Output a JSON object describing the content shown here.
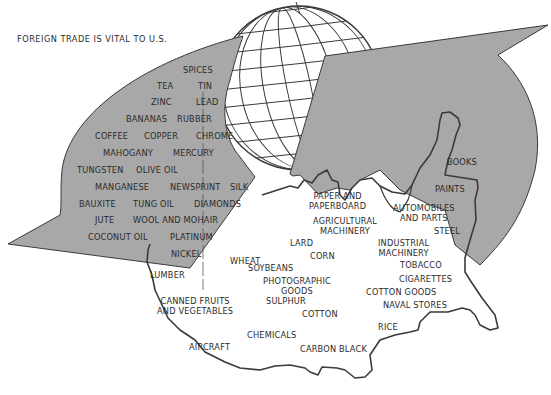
{
  "title": "FOREIGN TRADE IS VITAL TO U.S.",
  "colors": {
    "arrow_fill": "#a8a8a8",
    "outline": "#3a3a3a",
    "text": "#2b2b2b",
    "background": "#ffffff"
  },
  "imports": {
    "label": "Imports (left arrow into U.S.)",
    "items": [
      {
        "text": "SPICES",
        "x": 183,
        "y": 65
      },
      {
        "text": "TEA",
        "x": 157,
        "y": 81
      },
      {
        "text": "TIN",
        "x": 198,
        "y": 81
      },
      {
        "text": "ZINC",
        "x": 151,
        "y": 97
      },
      {
        "text": "LEAD",
        "x": 196,
        "y": 97
      },
      {
        "text": "BANANAS",
        "x": 126,
        "y": 114
      },
      {
        "text": "RUBBER",
        "x": 177,
        "y": 114
      },
      {
        "text": "COFFEE",
        "x": 95,
        "y": 131
      },
      {
        "text": "COPPER",
        "x": 144,
        "y": 131
      },
      {
        "text": "CHROME",
        "x": 196,
        "y": 131
      },
      {
        "text": "MAHOGANY",
        "x": 103,
        "y": 148
      },
      {
        "text": "MERCURY",
        "x": 173,
        "y": 148
      },
      {
        "text": "TUNGSTEN",
        "x": 77,
        "y": 165
      },
      {
        "text": "OLIVE OIL",
        "x": 136,
        "y": 165
      },
      {
        "text": "MANGANESE",
        "x": 95,
        "y": 182
      },
      {
        "text": "NEWSPRINT",
        "x": 170,
        "y": 182
      },
      {
        "text": "SILK",
        "x": 230,
        "y": 182
      },
      {
        "text": "BAUXITE",
        "x": 79,
        "y": 199
      },
      {
        "text": "TUNG OIL",
        "x": 133,
        "y": 199
      },
      {
        "text": "DIAMONDS",
        "x": 194,
        "y": 199
      },
      {
        "text": "JUTE",
        "x": 95,
        "y": 215
      },
      {
        "text": "WOOL AND MOHAIR",
        "x": 133,
        "y": 215
      },
      {
        "text": "COCONUT OIL",
        "x": 88,
        "y": 232
      },
      {
        "text": "PLATINUM",
        "x": 170,
        "y": 232
      },
      {
        "text": "NICKEL",
        "x": 171,
        "y": 249
      }
    ]
  },
  "exports": {
    "label": "Exports (from U.S. map)",
    "items": [
      {
        "text": "BOOKS",
        "x": 447,
        "y": 157
      },
      {
        "text": "PAINTS",
        "x": 435,
        "y": 184
      },
      {
        "text": "PAPER AND\nPAPERBOARD",
        "x": 309,
        "y": 191
      },
      {
        "text": "AUTOMOBILES\nAND PARTS",
        "x": 393,
        "y": 203
      },
      {
        "text": "AGRICULTURAL\nMACHINERY",
        "x": 313,
        "y": 216
      },
      {
        "text": "STEEL",
        "x": 434,
        "y": 226
      },
      {
        "text": "LARD",
        "x": 290,
        "y": 238
      },
      {
        "text": "INDUSTRIAL\nMACHINERY",
        "x": 378,
        "y": 238
      },
      {
        "text": "WHEAT",
        "x": 230,
        "y": 256
      },
      {
        "text": "CORN",
        "x": 310,
        "y": 251
      },
      {
        "text": "SOYBEANS",
        "x": 248,
        "y": 263
      },
      {
        "text": "TOBACCO",
        "x": 400,
        "y": 260
      },
      {
        "text": "PHOTOGRAPHIC\nGOODS",
        "x": 263,
        "y": 276
      },
      {
        "text": "CIGARETTES",
        "x": 399,
        "y": 274
      },
      {
        "text": "LUMBER",
        "x": 150,
        "y": 270
      },
      {
        "text": "COTTON GOODS",
        "x": 366,
        "y": 287
      },
      {
        "text": "CANNED FRUITS\nAND VEGETABLES",
        "x": 157,
        "y": 296
      },
      {
        "text": "SULPHUR",
        "x": 266,
        "y": 296
      },
      {
        "text": "NAVAL STORES",
        "x": 383,
        "y": 300
      },
      {
        "text": "COTTON",
        "x": 302,
        "y": 309
      },
      {
        "text": "RICE",
        "x": 378,
        "y": 322
      },
      {
        "text": "CHEMICALS",
        "x": 247,
        "y": 330
      },
      {
        "text": "AIRCRAFT",
        "x": 189,
        "y": 342
      },
      {
        "text": "CARBON BLACK",
        "x": 300,
        "y": 344
      }
    ]
  },
  "globe": {
    "cx": 299,
    "cy": 88,
    "r": 82
  }
}
